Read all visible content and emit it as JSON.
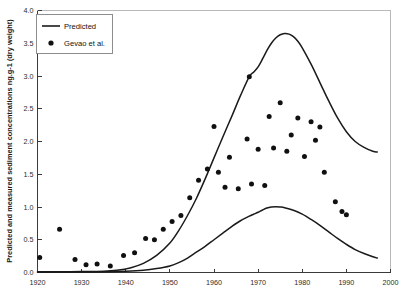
{
  "chart_data": {
    "type": "line",
    "title": "",
    "xlabel": "",
    "ylabel": "Predicted and measured sediment concentrations ng.g-1 (dry weight)",
    "xlim": [
      1920,
      2000
    ],
    "ylim": [
      0.0,
      4.0
    ],
    "grid": false,
    "xticks": [
      1920,
      1930,
      1940,
      1950,
      1960,
      1970,
      1980,
      1990,
      2000
    ],
    "xtick_labels": [
      "1920",
      "1930",
      "1940",
      "1950",
      "1960",
      "1970",
      "1980",
      "1990",
      "2000"
    ],
    "yticks": [
      0.0,
      0.5,
      1.0,
      1.5,
      2.0,
      2.5,
      3.0,
      3.5,
      4.0
    ],
    "ytick_labels": [
      "0.0",
      "0.5",
      "1.0",
      "1.5",
      "2.0",
      "2.5",
      "3.0",
      "3.5",
      "4.0"
    ],
    "legend_position": "upper-left",
    "legend": [
      {
        "label": "Predicted",
        "marker": "line"
      },
      {
        "label": "Gevao et al.",
        "marker": "dot"
      }
    ],
    "series": [
      {
        "name": "Predicted",
        "marker": "line",
        "points": [
          [
            1920.0,
            0.01
          ],
          [
            1925.0,
            0.012
          ],
          [
            1930.0,
            0.015
          ],
          [
            1935.0,
            0.02
          ],
          [
            1938.0,
            0.035
          ],
          [
            1941.0,
            0.07
          ],
          [
            1944.0,
            0.14
          ],
          [
            1947.0,
            0.26
          ],
          [
            1950.0,
            0.45
          ],
          [
            1952.0,
            0.64
          ],
          [
            1954.0,
            0.87
          ],
          [
            1956.0,
            1.13
          ],
          [
            1958.0,
            1.43
          ],
          [
            1960.0,
            1.75
          ],
          [
            1962.0,
            2.07
          ],
          [
            1964.0,
            2.38
          ],
          [
            1966.0,
            2.7
          ],
          [
            1968.0,
            2.99
          ],
          [
            1969.0,
            3.06
          ],
          [
            1970.0,
            3.14
          ],
          [
            1971.0,
            3.26
          ],
          [
            1972.0,
            3.39
          ],
          [
            1973.0,
            3.5
          ],
          [
            1974.0,
            3.58
          ],
          [
            1975.0,
            3.63
          ],
          [
            1976.0,
            3.65
          ],
          [
            1977.0,
            3.64
          ],
          [
            1978.0,
            3.6
          ],
          [
            1979.0,
            3.53
          ],
          [
            1980.0,
            3.43
          ],
          [
            1982.0,
            3.18
          ],
          [
            1984.0,
            2.9
          ],
          [
            1986.0,
            2.62
          ],
          [
            1988.0,
            2.36
          ],
          [
            1990.0,
            2.15
          ],
          [
            1992.0,
            2.0
          ],
          [
            1994.0,
            1.91
          ],
          [
            1996.0,
            1.85
          ],
          [
            1997.0,
            1.84
          ]
        ]
      },
      {
        "name": "Predicted lower",
        "marker": "line",
        "points": [
          [
            1920.0,
            0.005
          ],
          [
            1930.0,
            0.008
          ],
          [
            1936.0,
            0.012
          ],
          [
            1940.0,
            0.02
          ],
          [
            1944.0,
            0.035
          ],
          [
            1947.0,
            0.06
          ],
          [
            1950.0,
            0.1
          ],
          [
            1952.0,
            0.15
          ],
          [
            1954.0,
            0.22
          ],
          [
            1956.0,
            0.31
          ],
          [
            1958.0,
            0.4
          ],
          [
            1960.0,
            0.5
          ],
          [
            1962.0,
            0.6
          ],
          [
            1964.0,
            0.7
          ],
          [
            1966.0,
            0.79
          ],
          [
            1968.0,
            0.86
          ],
          [
            1969.0,
            0.89
          ],
          [
            1970.0,
            0.92
          ],
          [
            1971.0,
            0.955
          ],
          [
            1972.0,
            0.985
          ],
          [
            1973.0,
            1.0
          ],
          [
            1974.0,
            1.005
          ],
          [
            1975.0,
            1.0
          ],
          [
            1976.0,
            0.99
          ],
          [
            1978.0,
            0.95
          ],
          [
            1980.0,
            0.89
          ],
          [
            1982.0,
            0.81
          ],
          [
            1984.0,
            0.72
          ],
          [
            1986.0,
            0.62
          ],
          [
            1988.0,
            0.52
          ],
          [
            1990.0,
            0.43
          ],
          [
            1992.0,
            0.35
          ],
          [
            1994.0,
            0.29
          ],
          [
            1996.0,
            0.24
          ],
          [
            1997.0,
            0.22
          ]
        ]
      },
      {
        "name": "Gevao et al.",
        "marker": "dot",
        "points": [
          [
            1920.5,
            0.23
          ],
          [
            1925.0,
            0.66
          ],
          [
            1928.5,
            0.2
          ],
          [
            1931.0,
            0.12
          ],
          [
            1933.5,
            0.13
          ],
          [
            1936.5,
            0.1
          ],
          [
            1939.5,
            0.26
          ],
          [
            1942.0,
            0.3
          ],
          [
            1944.5,
            0.52
          ],
          [
            1946.5,
            0.5
          ],
          [
            1948.5,
            0.66
          ],
          [
            1950.5,
            0.78
          ],
          [
            1952.5,
            0.87
          ],
          [
            1954.5,
            1.14
          ],
          [
            1956.5,
            1.41
          ],
          [
            1958.5,
            1.58
          ],
          [
            1960.0,
            2.23
          ],
          [
            1961.0,
            1.53
          ],
          [
            1962.5,
            1.3
          ],
          [
            1963.5,
            1.76
          ],
          [
            1965.5,
            1.28
          ],
          [
            1967.5,
            2.04
          ],
          [
            1968.0,
            2.99
          ],
          [
            1968.5,
            1.35
          ],
          [
            1970.0,
            1.88
          ],
          [
            1971.5,
            1.33
          ],
          [
            1972.5,
            2.38
          ],
          [
            1973.5,
            1.9
          ],
          [
            1975.0,
            2.59
          ],
          [
            1976.5,
            1.85
          ],
          [
            1977.5,
            2.1
          ],
          [
            1979.0,
            2.36
          ],
          [
            1980.5,
            1.77
          ],
          [
            1982.0,
            2.3
          ],
          [
            1983.0,
            2.02
          ],
          [
            1984.0,
            2.22
          ],
          [
            1985.0,
            1.53
          ],
          [
            1987.5,
            1.08
          ],
          [
            1989.0,
            0.93
          ],
          [
            1990.0,
            0.88
          ]
        ]
      }
    ]
  }
}
